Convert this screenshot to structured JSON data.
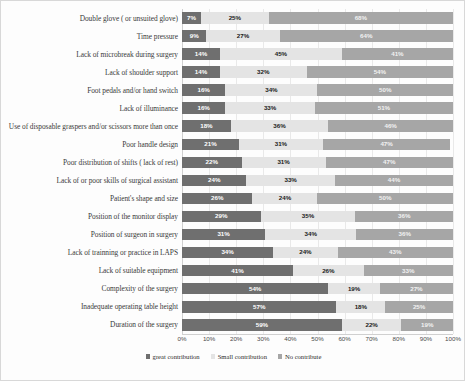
{
  "chart_data": {
    "type": "bar",
    "orientation": "horizontal",
    "stacked": true,
    "stacked_normalized": true,
    "title": "",
    "xlabel": "",
    "ylabel": "",
    "xlim": [
      0,
      100
    ],
    "grid": true,
    "legend_position": "bottom-center",
    "xticks": [
      "0%",
      "10%",
      "20%",
      "30%",
      "40%",
      "50%",
      "60%",
      "70%",
      "80%",
      "90%",
      "100%"
    ],
    "xtick_values": [
      0,
      10,
      20,
      30,
      40,
      50,
      60,
      70,
      80,
      90,
      100
    ],
    "categories": [
      "Double glove ( or unsuited glove)",
      "Time pressure",
      "Lack of microbreak during surgery",
      "Lack of shoulder support",
      "Foot pedals and/or hand switch",
      "Lack of illuminance",
      "Use of disposable graspers and/or scissors more than once",
      "Poor handle design",
      "Poor distribution of shifts ( lack of rest)",
      "Lack of or poor skills of surgical assistant",
      "Patient's shape and size",
      "Position of the monitor display",
      "Position of surgeon in surgery",
      "Lack of trainning or practice in LAPS",
      "Lack of suitable equipment",
      "Complexity of the surgery",
      "Inadequate operating table height",
      "Duration of the surgery"
    ],
    "series": [
      {
        "name": "great contribution",
        "color": "#6f6f6f",
        "values": [
          7,
          9,
          14,
          14,
          16,
          16,
          18,
          21,
          22,
          24,
          26,
          29,
          31,
          34,
          41,
          54,
          57,
          59
        ],
        "labels": [
          "7%",
          "9%",
          "14%",
          "14%",
          "16%",
          "16%",
          "18%",
          "21%",
          "22%",
          "24%",
          "26%",
          "29%",
          "31%",
          "34%",
          "41%",
          "54%",
          "57%",
          "59%"
        ]
      },
      {
        "name": "Small contribution",
        "color": "#e4e4e4",
        "values": [
          25,
          27,
          45,
          32,
          34,
          33,
          36,
          31,
          31,
          33,
          24,
          35,
          34,
          24,
          26,
          19,
          18,
          22
        ],
        "labels": [
          "25%",
          "27%",
          "45%",
          "32%",
          "34%",
          "33%",
          "36%",
          "31%",
          "31%",
          "33%",
          "24%",
          "35%",
          "34%",
          "24%",
          "26%",
          "19%",
          "18%",
          "22%"
        ]
      },
      {
        "name": "No contribute",
        "color": "#a6a6a6",
        "values": [
          68,
          64,
          41,
          54,
          50,
          51,
          46,
          47,
          47,
          44,
          50,
          36,
          36,
          43,
          33,
          27,
          25,
          19
        ],
        "labels": [
          "68%",
          "64%",
          "41%",
          "54%",
          "50%",
          "51%",
          "46%",
          "47%",
          "47%",
          "44%",
          "50%",
          "36%",
          "36%",
          "43%",
          "33%",
          "27%",
          "25%",
          "19%"
        ]
      }
    ]
  },
  "legend": {
    "items": [
      {
        "label": "great contribution",
        "color": "#6f6f6f"
      },
      {
        "label": "Small contribution",
        "color": "#e4e4e4"
      },
      {
        "label": "No contribute",
        "color": "#a6a6a6"
      }
    ]
  }
}
